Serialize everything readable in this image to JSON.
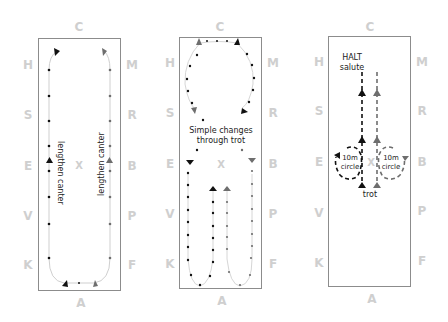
{
  "diagrams": [
    {
      "id": "arena-1",
      "letters": {
        "top": "C",
        "bottom": "A",
        "left": [
          "H",
          "S",
          "E",
          "V",
          "K"
        ],
        "right": [
          "M",
          "R",
          "B",
          "P",
          "F"
        ],
        "center": "X"
      },
      "annotations": {
        "left_track": "lengthen canter",
        "right_track": "lengthen canter"
      }
    },
    {
      "id": "arena-2",
      "letters": {
        "top": "C",
        "bottom": "A",
        "left": [
          "H",
          "S",
          "E",
          "V",
          "K"
        ],
        "right": [
          "M",
          "R",
          "B",
          "P",
          "F"
        ],
        "center": "X"
      },
      "annotations": {
        "caption_line1": "Simple changes",
        "caption_line2": "through trot"
      }
    },
    {
      "id": "arena-3",
      "letters": {
        "top": "C",
        "bottom": "A",
        "left": [
          "H",
          "S",
          "E",
          "V",
          "K"
        ],
        "right": [
          "M",
          "R",
          "B",
          "P",
          "F"
        ],
        "center": "X"
      },
      "annotations": {
        "halt_line1": "HALT",
        "halt_line2": "salute",
        "circle_left_1": "10m",
        "circle_left_2": "circle",
        "circle_right_1": "10m",
        "circle_right_2": "circle",
        "trot": "trot"
      }
    }
  ],
  "colors": {
    "path_primary": "#111111",
    "path_secondary": "#6e6e6e",
    "letters": "#cfcfcf",
    "border": "#8c8c8c"
  }
}
